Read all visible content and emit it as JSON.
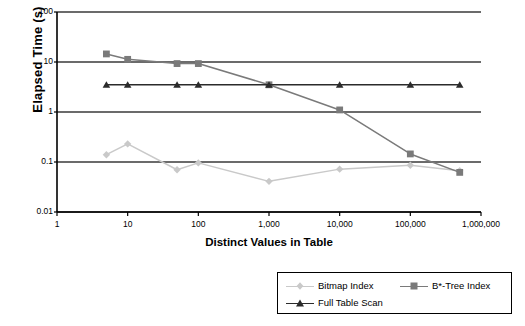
{
  "chart_data": {
    "type": "line",
    "title": "",
    "xlabel": "Distinct Values in Table",
    "ylabel": "Elapsed Time (s)",
    "xscale": "log",
    "yscale": "log",
    "xlim": [
      1,
      1000000
    ],
    "ylim": [
      0.01,
      100
    ],
    "grid": true,
    "legend_position": "bottom-right",
    "xticks": [
      "1",
      "10",
      "100",
      "1,000",
      "10,000",
      "100,000",
      "1,000,000"
    ],
    "xtick_values": [
      1,
      10,
      100,
      1000,
      10000,
      100000,
      1000000
    ],
    "yticks": [
      "100",
      "10",
      "1",
      "0.1",
      "0.01"
    ],
    "ytick_values": [
      100,
      10,
      1,
      0.1,
      0.01
    ],
    "x": [
      5,
      10,
      50,
      100,
      1000,
      10000,
      100000,
      500000
    ],
    "series": [
      {
        "name": "Bitmap Index",
        "color": "#c9c9c9",
        "marker": "diamond",
        "values": [
          0.14,
          0.23,
          0.07,
          0.096,
          0.041,
          0.072,
          0.086,
          0.067
        ]
      },
      {
        "name": "B*-Tree Index",
        "color": "#7a7a7a",
        "marker": "square",
        "values": [
          14.5,
          11.3,
          9.3,
          9.3,
          3.5,
          1.1,
          0.145,
          0.062
        ]
      },
      {
        "name": "Full Table Scan",
        "color": "#2b2b2b",
        "marker": "triangle",
        "values": [
          3.5,
          3.5,
          3.5,
          3.5,
          3.5,
          3.5,
          3.5,
          3.5
        ]
      }
    ]
  },
  "axes": {
    "y_label": "Elapsed Time (s)",
    "x_label": "Distinct Values in Table"
  },
  "legend": {
    "items": [
      {
        "label": "Bitmap Index"
      },
      {
        "label": "B*-Tree Index"
      },
      {
        "label": "Full Table Scan"
      }
    ]
  },
  "colors": {
    "axis": "#000000",
    "grid": "#3a3a3a",
    "bitmap": "#c9c9c9",
    "btree": "#7a7a7a",
    "fullscan": "#2b2b2b",
    "background": "#ffffff"
  }
}
